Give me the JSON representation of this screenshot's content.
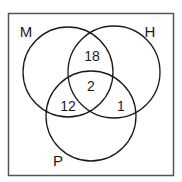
{
  "diagram": {
    "type": "venn-3",
    "frame": {
      "x": 8,
      "y": 13,
      "width": 166,
      "height": 163,
      "stroke": "#555555"
    },
    "sets": [
      {
        "id": "M",
        "label": "M",
        "cx": 68,
        "cy": 72,
        "r": 45,
        "label_x": 26,
        "label_y": 37
      },
      {
        "id": "H",
        "label": "H",
        "cx": 114,
        "cy": 72,
        "r": 46,
        "label_x": 145,
        "label_y": 37
      },
      {
        "id": "P",
        "label": "P",
        "cx": 91,
        "cy": 116,
        "r": 45,
        "label_x": 53,
        "label_y": 166
      }
    ],
    "regions": [
      {
        "sets": [
          "M",
          "H"
        ],
        "only": true,
        "value": "18",
        "x": 92,
        "y": 61
      },
      {
        "sets": [
          "M",
          "H",
          "P"
        ],
        "value": "2",
        "x": 91,
        "y": 91
      },
      {
        "sets": [
          "M",
          "P"
        ],
        "only": true,
        "value": "12",
        "x": 69,
        "y": 106
      },
      {
        "sets": [
          "H",
          "P"
        ],
        "only": true,
        "value": "1",
        "x": 121,
        "y": 106
      }
    ],
    "stroke_color": "#1a1a1a"
  }
}
